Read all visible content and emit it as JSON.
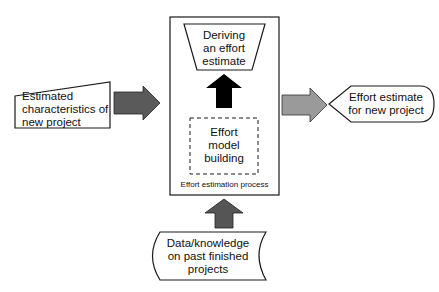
{
  "diagram": {
    "input_box": {
      "lines": [
        "Estimated",
        "characteristics of",
        "new project"
      ]
    },
    "process_box": {
      "caption": "Effort estimation process",
      "deriving": {
        "lines": [
          "Deriving",
          "an effort",
          "estimate"
        ]
      },
      "model_building": {
        "lines": [
          "Effort",
          "model",
          "building"
        ]
      }
    },
    "output_box": {
      "lines": [
        "Effort estimate",
        "for new project"
      ]
    },
    "data_box": {
      "lines": [
        "Data/knowledge",
        "on past finished",
        "projects"
      ]
    },
    "colors": {
      "arrow_input": "#5a5a5a",
      "arrow_output": "#9a9a9a",
      "arrow_internal": "#000000",
      "arrow_data": "#555555",
      "stroke": "#1a1a1a"
    }
  }
}
